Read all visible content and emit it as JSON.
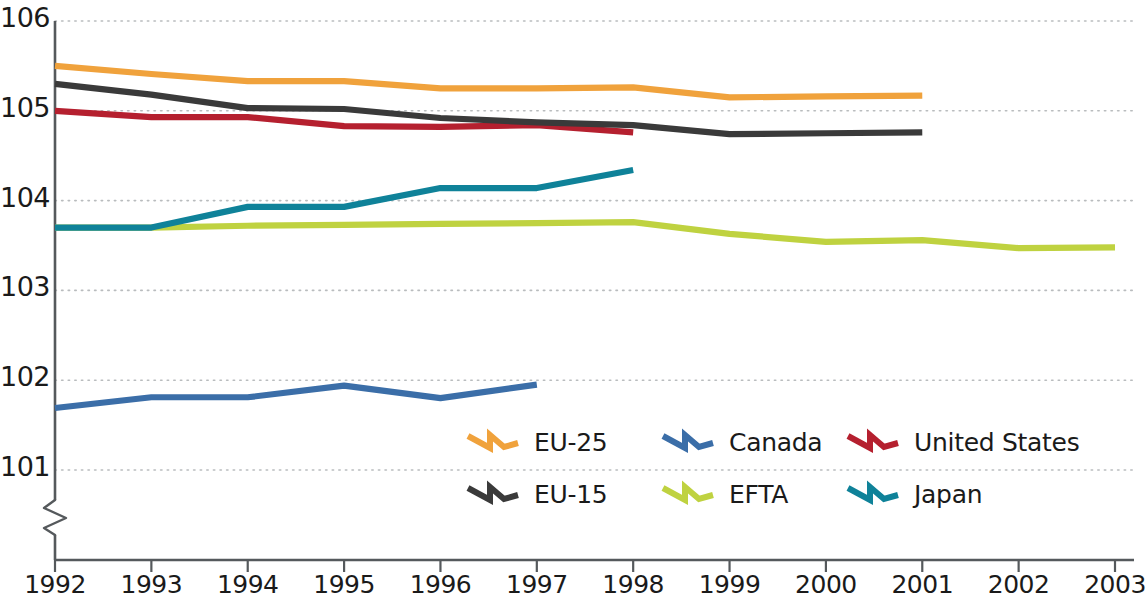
{
  "chart_data": {
    "type": "line",
    "title": "",
    "xlabel": "",
    "ylabel": "",
    "x": [
      1992,
      1993,
      1994,
      1995,
      1996,
      1997,
      1998,
      1999,
      2000,
      2001,
      2002,
      2003
    ],
    "xtick_labels": [
      "1992",
      "1993",
      "1994",
      "1995",
      "1996",
      "1997",
      "1998",
      "1999",
      "2000",
      "2001",
      "2002",
      "2003"
    ],
    "ytick_labels": [
      "101",
      "102",
      "103",
      "104",
      "105",
      "106"
    ],
    "yticks": [
      101,
      102,
      103,
      104,
      105,
      106
    ],
    "ylim": [
      101,
      106
    ],
    "xlim": [
      1992,
      2003
    ],
    "grid": "horizontal-dotted",
    "y_axis_break": true,
    "legend_position": "inside-lower-right",
    "series": [
      {
        "name": "EU-25",
        "color": "#F0A23C",
        "x": [
          1992,
          1993,
          1994,
          1995,
          1996,
          1997,
          1998,
          1999,
          2000,
          2001
        ],
        "values": [
          105.5,
          105.41,
          105.33,
          105.33,
          105.25,
          105.25,
          105.26,
          105.15,
          105.16,
          105.17
        ]
      },
      {
        "name": "Canada",
        "color": "#3B6EA8",
        "x": [
          1992,
          1993,
          1994,
          1995,
          1996,
          1997
        ],
        "values": [
          101.69,
          101.81,
          101.81,
          101.94,
          101.8,
          101.95
        ]
      },
      {
        "name": "United States",
        "color": "#B5202F",
        "x": [
          1992,
          1993,
          1994,
          1995,
          1996,
          1997,
          1998
        ],
        "values": [
          105.0,
          104.93,
          104.93,
          104.83,
          104.82,
          104.84,
          104.76
        ]
      },
      {
        "name": "EU-15",
        "color": "#3A3A3A",
        "x": [
          1992,
          1993,
          1994,
          1995,
          1996,
          1997,
          1998,
          1999,
          2000,
          2001
        ],
        "values": [
          105.3,
          105.18,
          105.03,
          105.02,
          104.92,
          104.87,
          104.84,
          104.74,
          104.75,
          104.76
        ]
      },
      {
        "name": "EFTA",
        "color": "#BFD240",
        "x": [
          1992,
          1993,
          1994,
          1995,
          1996,
          1997,
          1998,
          1999,
          2000,
          2001,
          2002,
          2003
        ],
        "values": [
          103.7,
          103.7,
          103.72,
          103.73,
          103.74,
          103.75,
          103.76,
          103.63,
          103.54,
          103.56,
          103.47,
          103.48
        ]
      },
      {
        "name": "Japan",
        "color": "#0F8299",
        "x": [
          1992,
          1993,
          1994,
          1995,
          1996,
          1997,
          1998
        ],
        "values": [
          103.7,
          103.7,
          103.93,
          103.93,
          104.14,
          104.14,
          104.34
        ]
      }
    ]
  },
  "legend": {
    "entries": [
      {
        "label": "EU-25",
        "color": "#F0A23C"
      },
      {
        "label": "Canada",
        "color": "#3B6EA8"
      },
      {
        "label": "United States",
        "color": "#B5202F"
      },
      {
        "label": "EU-15",
        "color": "#3A3A3A"
      },
      {
        "label": "EFTA",
        "color": "#BFD240"
      },
      {
        "label": "Japan",
        "color": "#0F8299"
      }
    ]
  },
  "axes": {
    "y_labels": [
      "106",
      "105",
      "104",
      "103",
      "102",
      "101"
    ],
    "x_labels": [
      "1992",
      "1993",
      "1994",
      "1995",
      "1996",
      "1997",
      "1998",
      "1999",
      "2000",
      "2001",
      "2002",
      "2003"
    ]
  },
  "colors": {
    "axis": "#55595c",
    "grid": "#b9bcbe",
    "text": "#1a1a1a",
    "background": "#ffffff"
  }
}
